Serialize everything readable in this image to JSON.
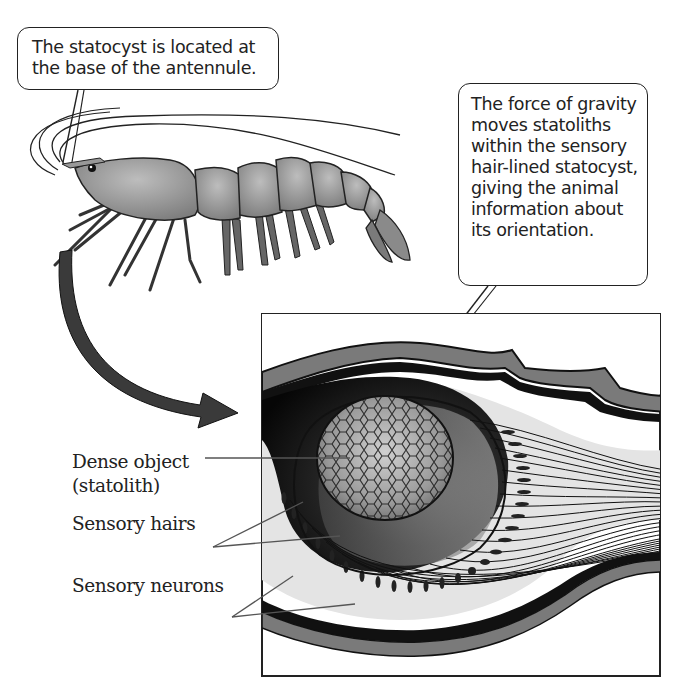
{
  "figure": {
    "callouts": {
      "location": {
        "lines": [
          "The statocyst is located at",
          "the base of the antennule."
        ]
      },
      "gravity": {
        "lines": [
          "The force of gravity",
          "moves statoliths",
          "within the sensory",
          "hair-lined statocyst,",
          "giving the animal",
          "information about",
          "its orientation."
        ]
      }
    },
    "labels": {
      "dense_object": [
        "Dense object",
        "(statolith)"
      ],
      "sensory_hairs": "Sensory hairs",
      "sensory_neurons": "Sensory neurons"
    },
    "colors": {
      "ink": "#222222",
      "dark_fill": "#111111",
      "mid_gray": "#7a7a7a",
      "light_gray": "#d8d8d8",
      "arrow": "#3a3a3a",
      "background": "#ffffff"
    }
  }
}
